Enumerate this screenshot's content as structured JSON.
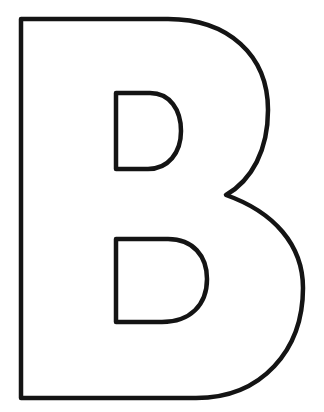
{
  "image": {
    "subject": "outlined letter B",
    "letter": "B",
    "style": "coloring page outline",
    "colors": {
      "background": "#ffffff",
      "outline": "#141414"
    }
  }
}
